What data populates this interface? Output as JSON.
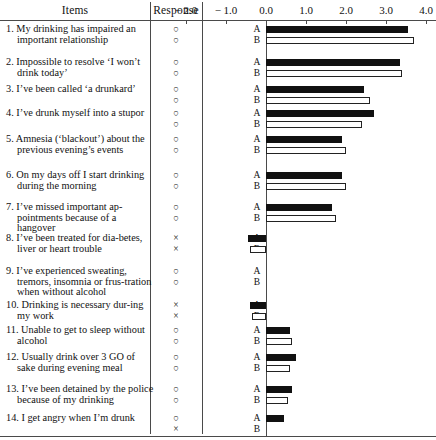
{
  "table": {
    "headers": {
      "items": "Items",
      "response": "Response"
    },
    "response_glyphs": {
      "circle": "○",
      "cross": "×"
    },
    "group_labels": {
      "a": "A",
      "b": "B"
    },
    "rows": [
      {
        "num": "1.",
        "text": "My drinking has impaired an important relationship",
        "response_a": "circle",
        "response_b": "circle"
      },
      {
        "num": "2.",
        "text": "Impossible to resolve ‘I won’t drink today’",
        "response_a": "circle",
        "response_b": "circle"
      },
      {
        "num": "3.",
        "text": "I’ve been called ‘a drunkard’",
        "response_a": "circle",
        "response_b": "circle"
      },
      {
        "num": "4.",
        "text": "I’ve drunk myself into a stupor",
        "response_a": "circle",
        "response_b": "circle"
      },
      {
        "num": "5.",
        "text": "Amnesia (‘blackout’) about the previous evening’s events",
        "response_a": "circle",
        "response_b": "circle"
      },
      {
        "num": "6.",
        "text": "On my days off I start drinking during the morning",
        "response_a": "circle",
        "response_b": "circle"
      },
      {
        "num": "7.",
        "text": "I’ve missed important ap-pointments because of a hangover",
        "response_a": "circle",
        "response_b": "circle"
      },
      {
        "num": "8.",
        "text": "I’ve been treated for dia-betes, liver or heart trouble",
        "response_a": "cross",
        "response_b": "cross"
      },
      {
        "num": "9.",
        "text": "I’ve experienced sweating, tremors, insomnia or frus-tration when without alcohol",
        "response_a": "circle",
        "response_b": "circle"
      },
      {
        "num": "10.",
        "text": "Drinking is necessary dur-ing my work",
        "response_a": "cross",
        "response_b": "cross"
      },
      {
        "num": "11.",
        "text": "Unable to get to sleep without alcohol",
        "response_a": "circle",
        "response_b": "circle"
      },
      {
        "num": "12.",
        "text": "Usually drink over 3 GO of sake during evening meal",
        "response_a": "circle",
        "response_b": "circle"
      },
      {
        "num": "13.",
        "text": "I’ve been detained by the police because of my drinking",
        "response_a": "circle",
        "response_b": "circle"
      },
      {
        "num": "14.",
        "text": "I get angry when I’m drunk",
        "response_a": "circle",
        "response_b": "cross"
      }
    ]
  },
  "chart_data": {
    "type": "bar",
    "orientation": "horizontal",
    "title": "",
    "xlabel": "",
    "ylabel": "",
    "xlim": [
      -2.0,
      4.0
    ],
    "xticks": [
      -2.0,
      -1.0,
      0.0,
      1.0,
      2.0,
      3.0,
      4.0
    ],
    "xticklabels": [
      "− 2.0",
      "− 1.0",
      "0.0",
      "1.0",
      "2.0",
      "3.0",
      "4.0"
    ],
    "grid": false,
    "legend": [
      "A",
      "B"
    ],
    "legend_position": "inline-row-labels",
    "colors": {
      "A": "#111111",
      "B": "#ffffff",
      "B_edge": "#222222",
      "axis": "#4a4a4a"
    },
    "categories": [
      "1. My drinking has impaired an important relationship",
      "2. Impossible to resolve ‘I won’t drink today’",
      "3. I’ve been called ‘a drunkard’",
      "4. I’ve drunk myself into a stupor",
      "5. Amnesia (‘blackout’) about the previous evening’s events",
      "6. On my days off I start drinking during the morning",
      "7. I’ve missed important appointments because of a hangover",
      "8. I’ve been treated for diabetes, liver or heart trouble",
      "9. I’ve experienced sweating, tremors, insomnia or frustration when without alcohol",
      "10. Drinking is necessary during my work",
      "11. Unable to get to sleep without alcohol",
      "12. Usually drink over 3 GO of sake during evening meal",
      "13. I’ve been detained by the police because of my drinking",
      "14. I get angry when I’m drunk"
    ],
    "series": [
      {
        "name": "A",
        "values": [
          3.55,
          3.35,
          2.45,
          2.7,
          1.9,
          1.9,
          1.65,
          -0.45,
          0.0,
          -0.4,
          0.6,
          0.75,
          0.65,
          0.45
        ]
      },
      {
        "name": "B",
        "values": [
          3.7,
          3.4,
          2.6,
          2.4,
          2.0,
          2.0,
          1.75,
          -0.4,
          0.0,
          -0.35,
          0.65,
          0.6,
          0.55,
          0.0
        ]
      }
    ]
  }
}
